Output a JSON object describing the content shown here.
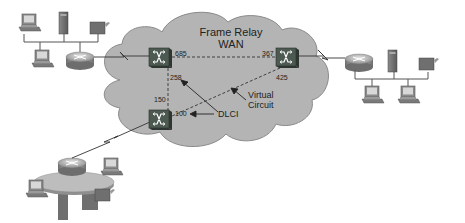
{
  "diagram": {
    "cloud": {
      "title_line1": "Frame Relay",
      "title_line2": "WAN",
      "fill": "#b4b4b4",
      "stroke": "#8a8a8a"
    },
    "switches": [
      {
        "id": "sw-top-left",
        "dlcis": [
          "685",
          "258"
        ]
      },
      {
        "id": "sw-top-right",
        "dlcis": [
          "367",
          "425"
        ]
      },
      {
        "id": "sw-bottom",
        "dlcis": [
          "150",
          "100"
        ]
      }
    ],
    "labels": {
      "dlci_685": "685",
      "dlci_367": "367",
      "dlci_258": "258",
      "dlci_425": "425",
      "dlci_150": "150",
      "dlci_100": "100",
      "dlci_annotation": "DLCI",
      "vc_line1": "Virtual",
      "vc_line2": "Circuit"
    },
    "sites": [
      {
        "id": "site-left",
        "devices": [
          "workstation",
          "server",
          "printer",
          "workstation",
          "router"
        ]
      },
      {
        "id": "site-right",
        "devices": [
          "router",
          "server",
          "printer",
          "workstation",
          "workstation"
        ]
      },
      {
        "id": "site-bottom-left",
        "devices": [
          "router",
          "workstation",
          "workstation",
          "server",
          "printer"
        ]
      }
    ],
    "colors": {
      "switch_body": "#4d5a52",
      "switch_side": "#2f3631",
      "device_gray": "#7a7a7a",
      "line": "#333333"
    }
  }
}
